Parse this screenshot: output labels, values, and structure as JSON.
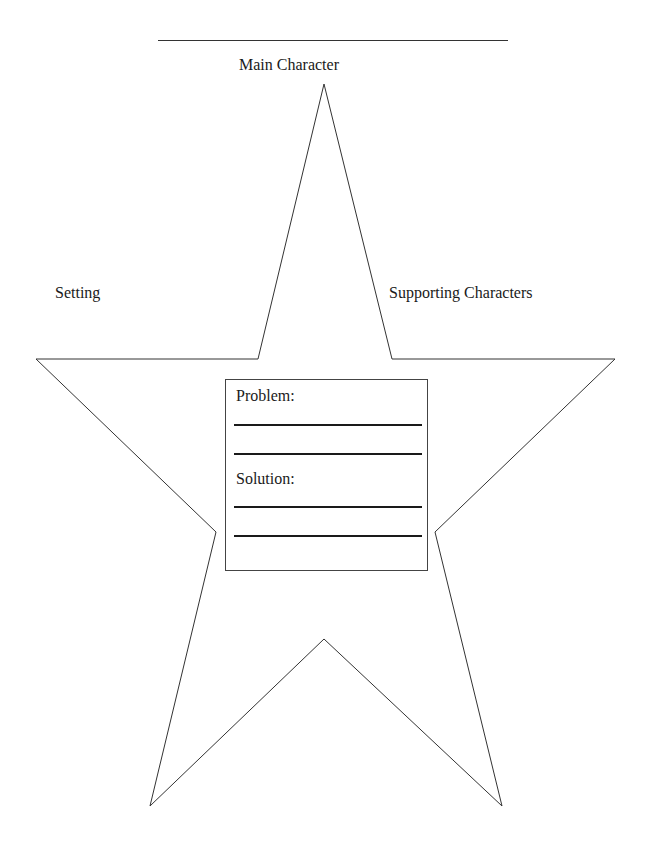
{
  "title_line": {
    "label": ""
  },
  "labels": {
    "main_character": "Main Character",
    "setting": "Setting",
    "supporting_characters": "Supporting Characters"
  },
  "center_box": {
    "problem_label": "Problem:",
    "solution_label": "Solution:",
    "problem_lines": 2,
    "solution_lines": 2
  },
  "colors": {
    "stroke": "#333333",
    "text": "#1a1a1a",
    "background": "#ffffff"
  }
}
